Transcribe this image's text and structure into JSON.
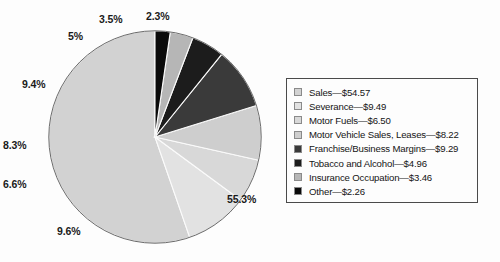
{
  "chart_data": {
    "type": "pie",
    "title": "",
    "subtitle": "",
    "xlabel": "",
    "ylabel": "",
    "legend_position": "right",
    "grid": false,
    "value_prefix": "$",
    "value_suffix": "",
    "total": 98.75,
    "start_angle_deg": 0,
    "direction": "counterclockwise",
    "categories": [
      "Sales",
      "Severance",
      "Motor Fuels",
      "Motor Vehicle Sales, Leases",
      "Franchise/Business Margins",
      "Tobacco and Alcohol",
      "Insurance Occupation",
      "Other"
    ],
    "values": [
      54.57,
      9.49,
      6.5,
      8.22,
      9.29,
      4.96,
      3.46,
      2.26
    ],
    "percent_labels": [
      "55.3%",
      "9.6%",
      "6.6%",
      "8.3%",
      "9.4%",
      "5%",
      "3.5%",
      "2.3%"
    ],
    "percents": [
      55.3,
      9.6,
      6.6,
      8.3,
      9.4,
      5.0,
      3.5,
      2.3
    ],
    "colors": [
      "#d2d2d2",
      "#e2e2e2",
      "#d8d8d8",
      "#cecece",
      "#3a3a3a",
      "#1c1c1c",
      "#b6b6b6",
      "#0a0a0a"
    ],
    "slices": [
      {
        "label": "Sales",
        "value": 54.57,
        "percent": 55.3,
        "percent_label": "55.3%",
        "color": "#d2d2d2",
        "legend_text": "Sales—$54.57"
      },
      {
        "label": "Severance",
        "value": 9.49,
        "percent": 9.6,
        "percent_label": "9.6%",
        "color": "#e2e2e2",
        "legend_text": "Severance—$9.49"
      },
      {
        "label": "Motor Fuels",
        "value": 6.5,
        "percent": 6.6,
        "percent_label": "6.6%",
        "color": "#d8d8d8",
        "legend_text": "Motor Fuels—$6.50"
      },
      {
        "label": "Motor Vehicle Sales, Leases",
        "value": 8.22,
        "percent": 8.3,
        "percent_label": "8.3%",
        "color": "#cecece",
        "legend_text": "Motor Vehicle Sales, Leases—$8.22"
      },
      {
        "label": "Franchise/Business Margins",
        "value": 9.29,
        "percent": 9.4,
        "percent_label": "9.4%",
        "color": "#3a3a3a",
        "legend_text": "Franchise/Business Margins—$9.29"
      },
      {
        "label": "Tobacco and Alcohol",
        "value": 4.96,
        "percent": 5.0,
        "percent_label": "5%",
        "color": "#1c1c1c",
        "legend_text": "Tobacco and Alcohol—$4.96"
      },
      {
        "label": "Insurance Occupation",
        "value": 3.46,
        "percent": 3.5,
        "percent_label": "3.5%",
        "color": "#b6b6b6",
        "legend_text": "Insurance Occupation—$3.46"
      },
      {
        "label": "Other",
        "value": 2.26,
        "percent": 2.3,
        "percent_label": "2.3%",
        "color": "#0a0a0a",
        "legend_text": "Other—$2.26"
      }
    ]
  },
  "legend": {
    "items": [
      "Sales—$54.57",
      "Severance—$9.49",
      "Motor Fuels—$6.50",
      "Motor Vehicle Sales, Leases—$8.22",
      "Franchise/Business Margins—$9.29",
      "Tobacco and Alcohol—$4.96",
      "Insurance Occupation—$3.46",
      "Other—$2.26"
    ]
  },
  "labels": {
    "sales": "55.3%",
    "severance": "9.6%",
    "motor_fuels": "6.6%",
    "motor_vehicle": "8.3%",
    "franchise": "9.4%",
    "tobacco": "5%",
    "insurance": "3.5%",
    "other": "2.3%"
  },
  "style": {
    "outline_color": "#5a5a5a",
    "separator_color": "#fbfbfb",
    "text_color": "#141414"
  }
}
